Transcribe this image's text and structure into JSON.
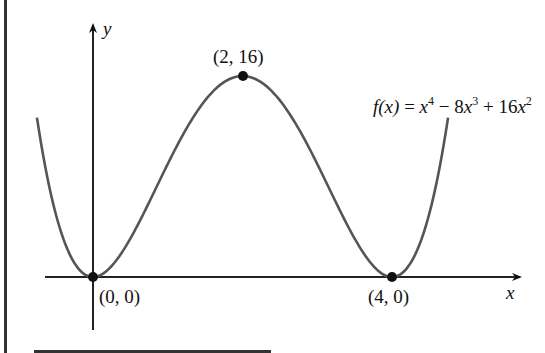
{
  "chart_data": {
    "type": "line",
    "title": "",
    "function_label": "f(x) = x^4 - 8x^3 + 16x^2",
    "xlabel": "x",
    "ylabel": "y",
    "x_range": [
      -0.75,
      4.75
    ],
    "grid": false,
    "legend": null,
    "series": [
      {
        "name": "f(x) = x^4 - 8x^3 + 16x^2",
        "x": [
          -0.75,
          -0.5,
          -0.25,
          0,
          0.5,
          1,
          1.5,
          2,
          2.5,
          3,
          3.5,
          4,
          4.25,
          4.5,
          4.75
        ],
        "y": [
          12.5,
          5.06,
          1.13,
          0,
          3.06,
          9,
          14.06,
          16,
          14.06,
          9,
          3.06,
          0,
          1.13,
          5.06,
          12.5
        ]
      }
    ],
    "points": [
      {
        "x": 0,
        "y": 0,
        "label": "(0, 0)"
      },
      {
        "x": 2,
        "y": 16,
        "label": "(2, 16)"
      },
      {
        "x": 4,
        "y": 0,
        "label": "(4, 0)"
      }
    ]
  },
  "labels": {
    "y_axis": "y",
    "x_axis": "x",
    "point_origin": "(0, 0)",
    "point_max": "(2, 16)",
    "point_root": "(4, 0)",
    "fn_lhs": "f(x)",
    "fn_eq": " = ",
    "fn_x1": "x",
    "fn_e1": "4",
    "fn_t2": " − 8",
    "fn_x2": "x",
    "fn_e2": "3",
    "fn_t3": " + 16",
    "fn_x3": "x",
    "fn_e3": "2"
  }
}
